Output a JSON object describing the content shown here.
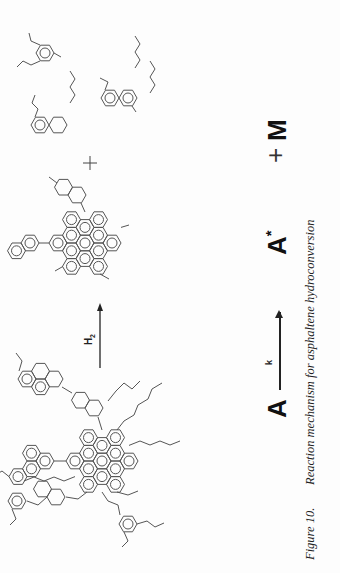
{
  "figure": {
    "reactant_label": "Asphaltene molecule (large polyaromatic core with alkyl chains)",
    "reagent": "H2",
    "reagent_main": "H",
    "reagent_sub": "2",
    "plus_sign": "+",
    "products": [
      "Hydrogenated aromatic core",
      "Aromatic fragments",
      "Alkyl chains"
    ]
  },
  "equation": {
    "reactant": "A",
    "rate_constant": "k",
    "product1": "A*",
    "product1_base": "A",
    "product1_star": "*",
    "plus": "+",
    "product2": "M"
  },
  "caption": {
    "label": "Figure 10.",
    "text": "Reaction mechanism for asphaltene hydroconversion"
  }
}
